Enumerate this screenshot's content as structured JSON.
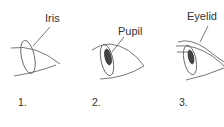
{
  "diagram": {
    "steps": [
      {
        "number": "1.",
        "label": "Iris"
      },
      {
        "number": "2.",
        "label": "Pupil"
      },
      {
        "number": "3.",
        "label": "Eyelid"
      }
    ],
    "colors": {
      "line": "#555555",
      "pupil": "#333333",
      "text": "#333333"
    }
  }
}
